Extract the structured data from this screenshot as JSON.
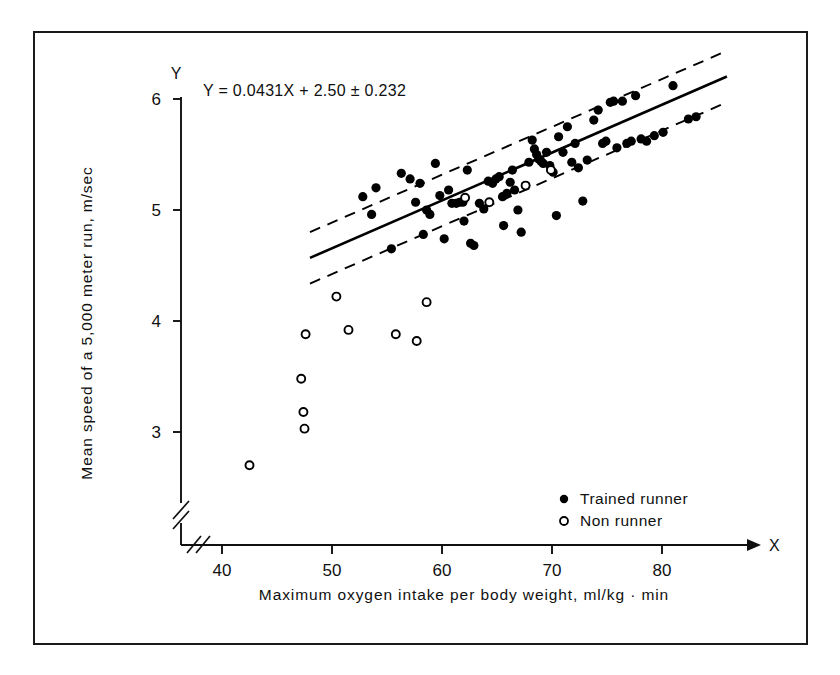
{
  "chart_data": {
    "type": "scatter",
    "title": "",
    "xlabel": "Maximum oxygen intake per body weight, ml/kg · min",
    "ylabel": "Mean speed of a 5,000 meter run, m/sec",
    "x_axis_letter": "X",
    "y_axis_letter": "Y",
    "xlim": [
      36.5,
      85.5
    ],
    "ylim": [
      2.35,
      6.25
    ],
    "xticks": [
      40,
      50,
      60,
      70,
      80
    ],
    "xticklabels": [
      "40",
      "50",
      "60",
      "70",
      "80"
    ],
    "yticks": [
      3,
      4,
      5,
      6
    ],
    "yticklabels": [
      "3",
      "4",
      "5",
      "6"
    ],
    "grid": false,
    "axis_break_x": true,
    "axis_break_y": true,
    "annotation": "Y = 0.0431X + 2.50 ± 0.232",
    "regression": {
      "slope": 0.0431,
      "intercept": 2.5,
      "se": 0.232,
      "line_x_range": [
        48.0,
        85.9
      ],
      "band_offset": 0.232,
      "line_style": "solid",
      "band_style": "dashed",
      "color": "#000000"
    },
    "legend": {
      "position": "bottom-right",
      "entries": [
        {
          "label": "Trained runner",
          "marker": "filled-circle"
        },
        {
          "label": "Non runner",
          "marker": "open-circle"
        }
      ]
    },
    "series": [
      {
        "name": "Trained runner",
        "marker": "filled-circle",
        "color": "#000000",
        "points": [
          [
            52.8,
            5.12
          ],
          [
            53.6,
            4.96
          ],
          [
            54.0,
            5.2
          ],
          [
            55.4,
            4.65
          ],
          [
            56.3,
            5.33
          ],
          [
            57.1,
            5.28
          ],
          [
            57.6,
            5.07
          ],
          [
            58.0,
            5.24
          ],
          [
            58.3,
            4.78
          ],
          [
            58.6,
            5.0
          ],
          [
            58.9,
            4.96
          ],
          [
            59.4,
            5.42
          ],
          [
            59.8,
            5.13
          ],
          [
            60.2,
            4.74
          ],
          [
            60.6,
            5.18
          ],
          [
            60.9,
            5.06
          ],
          [
            61.3,
            5.06
          ],
          [
            61.6,
            5.07
          ],
          [
            61.9,
            5.07
          ],
          [
            62.0,
            4.9
          ],
          [
            62.3,
            5.36
          ],
          [
            62.6,
            4.7
          ],
          [
            62.9,
            4.68
          ],
          [
            63.4,
            5.06
          ],
          [
            63.8,
            5.01
          ],
          [
            64.2,
            5.26
          ],
          [
            64.6,
            5.24
          ],
          [
            64.9,
            5.28
          ],
          [
            65.2,
            5.3
          ],
          [
            65.5,
            5.12
          ],
          [
            65.6,
            4.86
          ],
          [
            65.9,
            5.15
          ],
          [
            66.2,
            5.25
          ],
          [
            66.4,
            5.36
          ],
          [
            66.6,
            5.18
          ],
          [
            66.9,
            5.0
          ],
          [
            67.2,
            4.8
          ],
          [
            67.6,
            5.22
          ],
          [
            67.9,
            5.43
          ],
          [
            68.2,
            5.63
          ],
          [
            68.4,
            5.55
          ],
          [
            68.6,
            5.5
          ],
          [
            68.8,
            5.46
          ],
          [
            69.0,
            5.44
          ],
          [
            69.2,
            5.42
          ],
          [
            69.5,
            5.52
          ],
          [
            69.8,
            5.4
          ],
          [
            70.1,
            5.34
          ],
          [
            70.4,
            4.95
          ],
          [
            70.6,
            5.66
          ],
          [
            71.0,
            5.52
          ],
          [
            71.4,
            5.75
          ],
          [
            71.8,
            5.43
          ],
          [
            72.1,
            5.6
          ],
          [
            72.4,
            5.38
          ],
          [
            72.8,
            5.08
          ],
          [
            73.2,
            5.45
          ],
          [
            73.8,
            5.81
          ],
          [
            74.2,
            5.9
          ],
          [
            74.6,
            5.6
          ],
          [
            74.9,
            5.62
          ],
          [
            75.3,
            5.97
          ],
          [
            75.6,
            5.98
          ],
          [
            75.9,
            5.56
          ],
          [
            76.4,
            5.98
          ],
          [
            76.8,
            5.6
          ],
          [
            77.2,
            5.62
          ],
          [
            77.6,
            6.03
          ],
          [
            78.1,
            5.64
          ],
          [
            78.6,
            5.62
          ],
          [
            79.3,
            5.67
          ],
          [
            80.1,
            5.7
          ],
          [
            81.0,
            6.12
          ],
          [
            82.4,
            5.82
          ],
          [
            83.1,
            5.84
          ]
        ]
      },
      {
        "name": "Non runner",
        "marker": "open-circle",
        "color": "#000000",
        "points": [
          [
            42.5,
            2.7
          ],
          [
            47.2,
            3.48
          ],
          [
            47.4,
            3.18
          ],
          [
            47.5,
            3.03
          ],
          [
            47.6,
            3.88
          ],
          [
            50.4,
            4.22
          ],
          [
            51.5,
            3.92
          ],
          [
            55.8,
            3.88
          ],
          [
            57.7,
            3.82
          ],
          [
            58.6,
            4.17
          ],
          [
            62.1,
            5.11
          ],
          [
            64.3,
            5.07
          ],
          [
            67.6,
            5.22
          ],
          [
            69.9,
            5.36
          ]
        ]
      }
    ]
  }
}
